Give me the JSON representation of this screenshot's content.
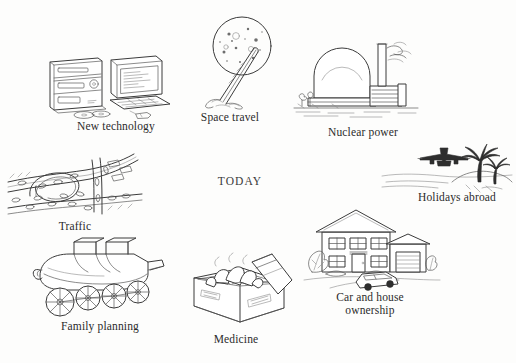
{
  "page": {
    "title": "Today",
    "center_label": "TODAY",
    "background_color": "#fdfdfc",
    "ink_color": "#3b3b3b",
    "width": 516,
    "height": 363
  },
  "items": [
    {
      "id": "new-technology",
      "caption": "New technology",
      "icon": "hifi-stereo-and-desktop-computer",
      "caption_x": 56,
      "caption_y": 120,
      "caption_width": 120
    },
    {
      "id": "space-travel",
      "caption": "Space travel",
      "icon": "rocket-launching-to-moon",
      "caption_x": 180,
      "caption_y": 111,
      "caption_width": 100
    },
    {
      "id": "nuclear-power",
      "caption": "Nuclear power",
      "icon": "nuclear-power-station-dome-and-chimney",
      "caption_x": 304,
      "caption_y": 126,
      "caption_width": 118
    },
    {
      "id": "holidays-abroad",
      "caption": "Holidays abroad",
      "icon": "airliner-over-palm-island",
      "caption_x": 398,
      "caption_y": 191,
      "caption_width": 118
    },
    {
      "id": "traffic",
      "caption": "Traffic",
      "icon": "congested-motorway-junction",
      "caption_x": 30,
      "caption_y": 220,
      "caption_width": 90
    },
    {
      "id": "family-planning",
      "caption": "Family planning",
      "icon": "baby-pram",
      "caption_x": 36,
      "caption_y": 320,
      "caption_width": 128
    },
    {
      "id": "medicine",
      "caption": "Medicine",
      "icon": "open-box-of-tablets",
      "caption_x": 182,
      "caption_y": 333,
      "caption_width": 108
    },
    {
      "id": "car-and-house-ownership",
      "caption": "Car and house\nownership",
      "icon": "detached-house-with-garage-and-car",
      "caption_x": 311,
      "caption_y": 291,
      "caption_width": 118
    }
  ]
}
